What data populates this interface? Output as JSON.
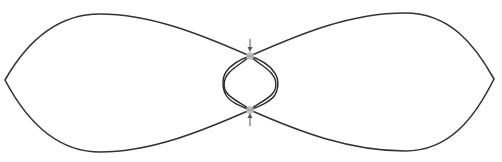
{
  "diagram": {
    "title": "",
    "description": "Figure-eight (lemniscate-like) closed curve with two outer lobes and a narrow central waist containing braided inner strands; two crossing points marked with arrows",
    "colors": {
      "background": "#ffffff",
      "stroke": "#333333",
      "node": "#bdbdbd",
      "arrow": "#555555"
    },
    "lobes": [
      {
        "id": "left-lobe",
        "tip": [
          5,
          80
        ],
        "top": [
          100,
          14
        ],
        "bottom": [
          100,
          152
        ]
      },
      {
        "id": "right-lobe",
        "tip": [
          494,
          79
        ],
        "top": [
          405,
          13
        ],
        "bottom": [
          405,
          151
        ]
      }
    ],
    "crossings": [
      {
        "id": "top-crossing",
        "point": [
          250,
          56
        ]
      },
      {
        "id": "bottom-crossing",
        "point": [
          250,
          110
        ]
      }
    ],
    "arrows": [
      {
        "id": "top-arrow",
        "direction": "down",
        "from": [
          250,
          39
        ],
        "to": [
          250,
          51
        ]
      },
      {
        "id": "bottom-arrow",
        "direction": "up",
        "from": [
          250,
          126
        ],
        "to": [
          250,
          114
        ]
      }
    ],
    "inner_strands": {
      "left_extreme_x": 223,
      "right_extreme_x": 278,
      "center_y": 83,
      "strand_count_per_side": 2
    }
  }
}
